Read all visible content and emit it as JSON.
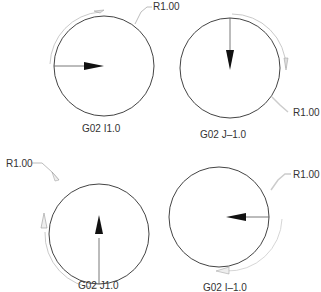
{
  "diagrams": [
    {
      "caption": "G02 I1.0",
      "radius_label": "R1.00",
      "direction": "clockwise",
      "vector": "I1.0"
    },
    {
      "caption": "G02 J–1.0",
      "radius_label": "R1.00",
      "direction": "clockwise",
      "vector": "J-1.0"
    },
    {
      "caption": "G02 J1.0",
      "radius_label": "R1.00",
      "direction": "clockwise",
      "vector": "J1.0"
    },
    {
      "caption": "G02 I–1.0",
      "radius_label": "R1.00",
      "direction": "clockwise",
      "vector": "I-1.0"
    }
  ],
  "colors": {
    "circle": "#444444",
    "arrow": "#111111",
    "arc_guide": "#bbbbbb",
    "leader": "#aaaaaa"
  }
}
